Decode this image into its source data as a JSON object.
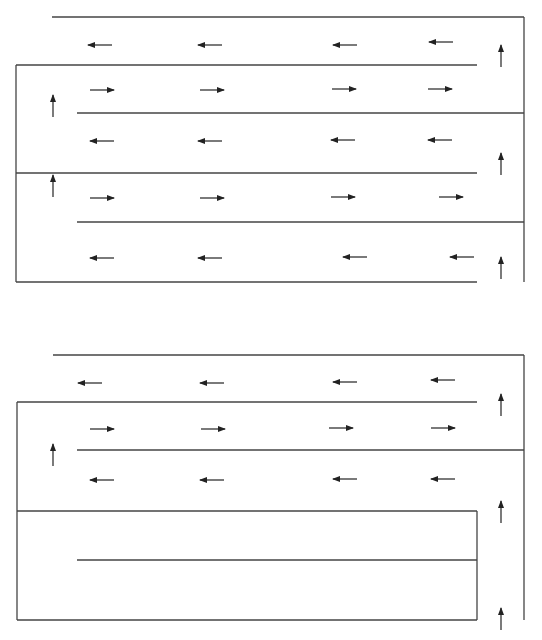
{
  "diagram": {
    "title": "",
    "line_color": "#444444",
    "arrow_color": "#222222",
    "panels": [
      {
        "name": "top-panel",
        "walls": [
          [
            52,
            17,
            524,
            17
          ],
          [
            16,
            65,
            477,
            65
          ],
          [
            77,
            113,
            524,
            113
          ],
          [
            16,
            173,
            477,
            173
          ],
          [
            77,
            222,
            524,
            222
          ],
          [
            16,
            282,
            477,
            282
          ],
          [
            16,
            65,
            16,
            282
          ],
          [
            524,
            17,
            524,
            282
          ]
        ],
        "arrows": [
          {
            "x": 100,
            "y": 45,
            "dir": "left"
          },
          {
            "x": 210,
            "y": 45,
            "dir": "left"
          },
          {
            "x": 345,
            "y": 45,
            "dir": "left"
          },
          {
            "x": 441,
            "y": 42,
            "dir": "left"
          },
          {
            "x": 102,
            "y": 90,
            "dir": "right"
          },
          {
            "x": 212,
            "y": 90,
            "dir": "right"
          },
          {
            "x": 344,
            "y": 89,
            "dir": "right"
          },
          {
            "x": 440,
            "y": 89,
            "dir": "right"
          },
          {
            "x": 102,
            "y": 141,
            "dir": "left"
          },
          {
            "x": 210,
            "y": 141,
            "dir": "left"
          },
          {
            "x": 343,
            "y": 140,
            "dir": "left"
          },
          {
            "x": 440,
            "y": 140,
            "dir": "left"
          },
          {
            "x": 102,
            "y": 198,
            "dir": "right"
          },
          {
            "x": 212,
            "y": 198,
            "dir": "right"
          },
          {
            "x": 343,
            "y": 197,
            "dir": "right"
          },
          {
            "x": 451,
            "y": 197,
            "dir": "right"
          },
          {
            "x": 102,
            "y": 258,
            "dir": "left"
          },
          {
            "x": 210,
            "y": 258,
            "dir": "left"
          },
          {
            "x": 355,
            "y": 257,
            "dir": "left"
          },
          {
            "x": 462,
            "y": 257,
            "dir": "left"
          },
          {
            "x": 53,
            "y": 117,
            "dir": "up"
          },
          {
            "x": 53,
            "y": 197,
            "dir": "up"
          },
          {
            "x": 501,
            "y": 67,
            "dir": "up"
          },
          {
            "x": 501,
            "y": 175,
            "dir": "up"
          },
          {
            "x": 501,
            "y": 279,
            "dir": "up"
          }
        ]
      },
      {
        "name": "bottom-panel",
        "walls": [
          [
            53,
            355,
            524,
            355
          ],
          [
            17,
            402,
            477,
            402
          ],
          [
            77,
            450,
            524,
            450
          ],
          [
            17,
            511,
            477,
            511
          ],
          [
            77,
            560,
            477,
            560
          ],
          [
            17,
            620,
            477,
            620
          ],
          [
            17,
            402,
            17,
            620
          ],
          [
            477,
            511,
            477,
            620
          ],
          [
            524,
            355,
            524,
            620
          ]
        ],
        "arrows": [
          {
            "x": 90,
            "y": 383,
            "dir": "left"
          },
          {
            "x": 212,
            "y": 383,
            "dir": "left"
          },
          {
            "x": 345,
            "y": 382,
            "dir": "left"
          },
          {
            "x": 443,
            "y": 380,
            "dir": "left"
          },
          {
            "x": 102,
            "y": 429,
            "dir": "right"
          },
          {
            "x": 213,
            "y": 429,
            "dir": "right"
          },
          {
            "x": 341,
            "y": 428,
            "dir": "right"
          },
          {
            "x": 443,
            "y": 428,
            "dir": "right"
          },
          {
            "x": 102,
            "y": 480,
            "dir": "left"
          },
          {
            "x": 212,
            "y": 480,
            "dir": "left"
          },
          {
            "x": 345,
            "y": 479,
            "dir": "left"
          },
          {
            "x": 443,
            "y": 479,
            "dir": "left"
          },
          {
            "x": 53,
            "y": 466,
            "dir": "up"
          },
          {
            "x": 501,
            "y": 416,
            "dir": "up"
          },
          {
            "x": 501,
            "y": 523,
            "dir": "up"
          },
          {
            "x": 501,
            "y": 630,
            "dir": "up"
          }
        ]
      }
    ]
  }
}
